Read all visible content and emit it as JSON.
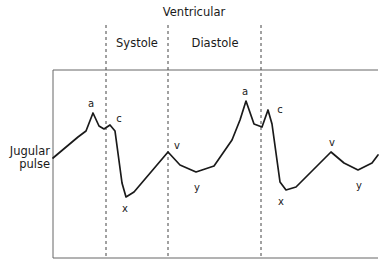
{
  "figure": {
    "phase_title": "Ventricular",
    "phase_systole": "Systole",
    "phase_diastole": "Diastole",
    "y_axis_label_line1": "Jugular",
    "y_axis_label_line2": "pulse"
  },
  "wave_labels": {
    "a1": "a",
    "c1": "c",
    "x1": "x",
    "v1": "v",
    "y1": "y",
    "a2": "a",
    "c2": "c",
    "x2": "x",
    "v2": "v",
    "y2": "y"
  },
  "colors": {
    "trace": "#1a1a1a",
    "frame": "#555555",
    "dashed": "#444444",
    "text": "#1a1a1a",
    "background": "#ffffff"
  },
  "chart_data": {
    "type": "line",
    "xlabel": "",
    "ylabel": "Jugular pulse",
    "grid": false,
    "legend": null,
    "annotations": [
      {
        "label": "Ventricular",
        "kind": "phase-group-title"
      },
      {
        "label": "Systole",
        "kind": "phase",
        "x_start": 106,
        "x_end": 168
      },
      {
        "label": "Diastole",
        "kind": "phase",
        "x_start": 168,
        "x_end": 261
      }
    ],
    "dashed_dividers_x": [
      106,
      168,
      261
    ],
    "frame": {
      "left": 53,
      "top": 70,
      "right": 378,
      "bottom": 258
    },
    "waves": [
      {
        "name": "a",
        "cycle": 1,
        "type": "peak",
        "x": 93,
        "y": 113
      },
      {
        "name": "c",
        "cycle": 1,
        "type": "peak",
        "x": 110,
        "y": 125
      },
      {
        "name": "x",
        "cycle": 1,
        "type": "trough",
        "x": 126,
        "y": 197
      },
      {
        "name": "v",
        "cycle": 1,
        "type": "peak",
        "x": 168,
        "y": 152
      },
      {
        "name": "y",
        "cycle": 1,
        "type": "trough",
        "x": 196,
        "y": 172
      },
      {
        "name": "a",
        "cycle": 2,
        "type": "peak",
        "x": 246,
        "y": 101
      },
      {
        "name": "c",
        "cycle": 2,
        "type": "peak",
        "x": 268,
        "y": 110
      },
      {
        "name": "x",
        "cycle": 2,
        "type": "trough",
        "x": 282,
        "y": 190
      },
      {
        "name": "v",
        "cycle": 2,
        "type": "peak",
        "x": 331,
        "y": 152
      },
      {
        "name": "y",
        "cycle": 2,
        "type": "trough",
        "x": 358,
        "y": 170
      }
    ],
    "trace_path": "M 53,158 L 78,137 L 86,131 L 93,113 L 99,126 L 104,129 L 110,125 L 115,131 L 122,183 L 126,197 L 134,192 L 168,152 L 180,165 L 196,172 L 214,166 L 232,140 L 240,120 L 246,101 L 254,124 L 262,127 L 268,110 L 272,124 L 280,182 L 286,190 L 296,187 L 331,152 L 344,163 L 358,170 L 372,163 L 378,155"
  }
}
